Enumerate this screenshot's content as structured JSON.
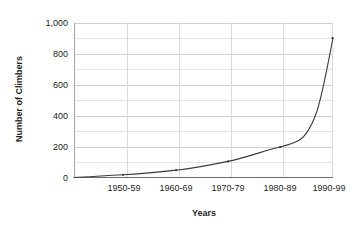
{
  "chart_data": {
    "type": "line",
    "title": "",
    "xlabel": "Years",
    "ylabel": "Number of Climbers",
    "categories": [
      "1950-59",
      "1960-69",
      "1970-79",
      "1980-89",
      "1990-99"
    ],
    "values": [
      5,
      35,
      85,
      190,
      900
    ],
    "series": [
      {
        "name": "Number of Climbers",
        "values": [
          5,
          35,
          85,
          190,
          900
        ]
      }
    ],
    "ylim": [
      0,
      1000
    ],
    "ytick_labels": [
      "0",
      "200",
      "400",
      "600",
      "800",
      "1,000"
    ],
    "ytick_values": [
      0,
      200,
      400,
      600,
      800,
      1000
    ],
    "xtick_labels": [
      "1950-59",
      "1960-69",
      "1970-79",
      "1980-89",
      "1990-99"
    ],
    "grid": "both",
    "minor_grid_step": 100,
    "legend": "none",
    "line_color": "#3b3b3b",
    "grid_color": "#d9d9d9",
    "axis_color": "#a6a6a6",
    "text_color": "#231f20",
    "background_color": "#ffffff",
    "annotations": [],
    "curve_path": "M 74,177.5 C 92,176.6 108,175.4 123,174.8 C 145,173.6 163,171.6 176,170.2 C 196,168.0 215,164.1 228,161.4 C 247,157.4 264,150.8 280,147.0 C 288,145.1 294,143.2 299,140.3 C 307,135.5 312,125.5 317,111.0 C 323,92.0 328,63.0 333,38.0"
  },
  "axes": {
    "y_axis_title": "Number of Climbers",
    "x_axis_title": "Years"
  }
}
